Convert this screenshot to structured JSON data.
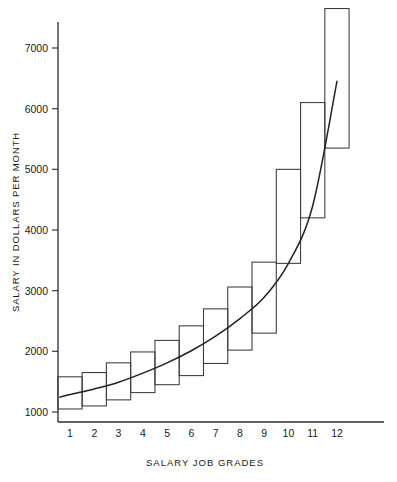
{
  "chart_data": {
    "type": "bar",
    "title": "",
    "subtitle": "",
    "xlabel": "SALARY JOB GRADES",
    "ylabel": "SALARY IN DOLLARS PER MONTH",
    "categories": [
      "1",
      "2",
      "3",
      "4",
      "5",
      "6",
      "7",
      "8",
      "9",
      "10",
      "11",
      "12"
    ],
    "x_tick_labels": [
      "1",
      "2",
      "3",
      "4",
      "5",
      "6",
      "7",
      "8",
      "9",
      "10",
      "11",
      "12"
    ],
    "y_tick_labels": [
      "1000",
      "2000",
      "3000",
      "4000",
      "5000",
      "6000",
      "7000"
    ],
    "y_ticks": [
      1000,
      2000,
      3000,
      4000,
      5000,
      6000,
      7000
    ],
    "ylim": [
      900,
      7750
    ],
    "xlim": [
      0.5,
      12.5
    ],
    "grid": false,
    "legend": null,
    "legend_position": "none",
    "series": [
      {
        "name": "Salary range boxes",
        "type": "range-boxes",
        "note": "Each job grade is drawn as an open rectangle spanning its minimum to maximum monthly salary.",
        "values": [
          {
            "grade": "1",
            "min": 1050,
            "max": 1580
          },
          {
            "grade": "2",
            "min": 1100,
            "max": 1650
          },
          {
            "grade": "3",
            "min": 1200,
            "max": 1810
          },
          {
            "grade": "4",
            "min": 1320,
            "max": 1990
          },
          {
            "grade": "5",
            "min": 1450,
            "max": 2180
          },
          {
            "grade": "6",
            "min": 1600,
            "max": 2420
          },
          {
            "grade": "7",
            "min": 1800,
            "max": 2700
          },
          {
            "grade": "8",
            "min": 2020,
            "max": 3060
          },
          {
            "grade": "9",
            "min": 2300,
            "max": 3470
          },
          {
            "grade": "10",
            "min": 3450,
            "max": 5000
          },
          {
            "grade": "11",
            "min": 4200,
            "max": 6100
          },
          {
            "grade": "12",
            "min": 5350,
            "max": 7650
          }
        ]
      },
      {
        "name": "Salary midpoint trend curve",
        "type": "line",
        "note": "Smooth exponential curve passing through the grade midpoints.",
        "x": [
          1,
          2,
          3,
          4,
          5,
          6,
          7,
          8,
          9,
          10,
          11,
          12
        ],
        "values": [
          1290,
          1380,
          1490,
          1640,
          1810,
          2010,
          2250,
          2540,
          2890,
          3450,
          4400,
          6450
        ]
      }
    ]
  },
  "axes": {
    "y_axis_name": "y-axis",
    "x_axis_name": "x-axis"
  }
}
